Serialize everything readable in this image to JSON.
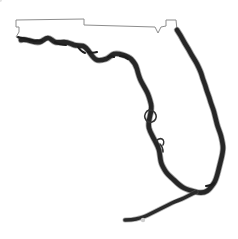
{
  "image": {
    "kind": "outline-map",
    "subject": "Florida",
    "title": "Florida state outline map",
    "width": 238,
    "height": 239,
    "background_color": "#ffffff",
    "has_interior_fill": false,
    "has_visible_text_labels": false
  },
  "palette": {
    "background": "#ffffff",
    "coastline_dark": "#262626",
    "coastline_halo_gray": "#5e5e5e",
    "state_border_gray": "#8d8d8d",
    "keys_dark": "#2a2a2a",
    "artifact_light_gray": "#cfcfcf",
    "artifact_faint_gray": "#e2e2e2"
  },
  "features": [
    {
      "id": "northern-state-border",
      "name": "Northern state border (Alabama and Georgia line)",
      "style": "thin light gray line",
      "stroke": "#8d8d8d",
      "stroke_width": 1,
      "description": "Runs from the western panhandle tip east along a straight horizontal line, steps down near the Apalachicola meridian, continues east, then makes a small downward-and-up notch at the St. Marys River before reaching the northeast corner.",
      "path": "M 16 20 L 16 27 L 19 27 L 19 32 L 16 37 L 21 40 M 16 20 L 84 19 L 84 25 L 155 27 L 158 33 L 161 27 L 166 26 L 166 20 L 176 20 L 177 30"
    },
    {
      "id": "gulf-coastline-panhandle",
      "name": "Gulf of Mexico coastline, panhandle",
      "style": "thick dark stroke",
      "stroke": "#262626",
      "stroke_width": 4.6,
      "description": "Heavily detailed barrier-island coast from Perdido Key east past Pensacola, Choctawhatchee, Panama City and Apalachicola Bay."
    },
    {
      "id": "gulf-coastline-bigbend",
      "name": "Gulf coastline, Big Bend",
      "style": "thick dark stroke",
      "stroke": "#262626",
      "description": "Sweeps south and east around the Big Bend below Apalachee Bay toward Cedar Key."
    },
    {
      "id": "gulf-coastline-peninsula",
      "name": "Gulf coastline, west peninsula",
      "style": "thick dark stroke",
      "stroke": "#262626",
      "description": "Descends south past Tampa Bay (pronounced bulge), Charlotte Harbor and Fort Myers toward the Ten Thousand Islands."
    },
    {
      "id": "atlantic-coastline",
      "name": "Atlantic coastline, east side",
      "style": "thick dark stroke",
      "stroke": "#262626",
      "description": "Long gently bowed line from the northeast corner near Fernandina Beach south past Cape Canaveral to the Miami area, then bending west."
    },
    {
      "id": "southern-tip",
      "name": "Southern tip and Florida Bay",
      "style": "thick dark stroke",
      "stroke": "#262626",
      "description": "The rounded south end of the peninsula curving west from Miami into Florida Bay and the Everglades coast."
    },
    {
      "id": "florida-keys",
      "name": "Florida Keys island chain",
      "style": "thick broken dark stroke",
      "stroke": "#2a2a2a",
      "description": "A tapering arc of islands running west-southwest from the south tip toward Key West."
    },
    {
      "id": "artifact-left-edge",
      "name": "Scan artifact near left edge",
      "style": "small faint gray speck",
      "stroke": "#cfcfcf",
      "position": {
        "x": 3,
        "y": 118
      }
    },
    {
      "id": "artifact-dry-tortugas",
      "name": "Faint speck near Dry Tortugas position",
      "style": "very faint gray speck",
      "stroke": "#e2e2e2",
      "position": {
        "x": 143,
        "y": 220
      }
    }
  ],
  "geometry": {
    "coastline_path": "M 21 40 C 24 39 28 40 31 41 C 34 42 37 43 40 42 C 43 41 45 38 48 38 C 51 38 52 41 55 42 C 58 43 61 42 64 42 C 68 42 71 44 74 45 C 77 46 80 45 83 46 C 86 47 88 50 90 53 C 92 56 94 59 97 60 C 100 61 103 60 106 59 C 109 58 111 55 114 54 C 117 53 120 54 123 55 C 126 56 129 57 131 59 C 134 62 136 65 137 69 C 138 73 139 77 141 81 C 143 85 145 88 147 92 C 149 96 150 100 151 104 C 152 108 151 112 150 116 C 149 120 148 124 149 128 C 150 132 152 135 154 139 C 156 143 158 146 159 150 C 160 154 160 158 161 162 C 162 166 164 169 166 172 C 168 175 171 177 174 180 C 177 183 180 186 184 188 C 188 190 192 191 196 192 C 200 193 204 193 207 191 C 210 189 212 186 214 183 C 216 180 217 176 218 172 C 219 168 220 164 221 160 C 222 156 223 152 223 148 C 223 144 222 140 221 136 C 220 132 218 128 217 124 C 216 120 215 116 214 112 C 213 108 211 104 210 100 C 209 96 207 92 206 88 C 205 84 203 80 202 76 C 201 72 199 68 197 64 C 195 60 192 56 190 52 C 188 48 185 44 183 40 C 181 36 179 33 177 30",
    "keys_path": "M 196 192 C 192 194 188 196 184 198 C 180 200 176 201 172 203 C 168 205 164 207 160 209 C 156 211 152 213 148 215 C 144 217 140 218 136 219 C 132 220 128 220 125 220",
    "panhandle_detail_path": "M 18 37 C 21 38 24 38 27 39 C 30 40 33 41 36 41 M 33 41 C 36 40 39 40 42 41 M 55 42 C 58 44 62 45 66 45 M 78 47 C 80 50 82 52 85 53 M 88 52 C 91 53 94 53 97 52",
    "bigbend_detail_path": "M 108 57 C 110 56 112 56 114 57 M 120 56 C 123 56 126 57 128 59",
    "tampa_detail_path": "M 149 110 C 152 110 155 112 156 115 C 157 118 155 121 152 122 C 149 123 146 121 145 118 C 144 115 146 111 149 110",
    "charlotte_detail_path": "M 156 141 C 158 139 160 138 162 139 C 164 140 164 143 163 145 M 160 144 C 162 146 163 149 163 152",
    "miami_detail_path": "M 206 186 C 209 186 212 185 214 183"
  },
  "accessibility": {
    "alt_text": "Black and white outline map of the state of Florida showing a thin gray northern border and a thick dark coastline, with the Florida Keys trailing southwest from the peninsula tip."
  }
}
